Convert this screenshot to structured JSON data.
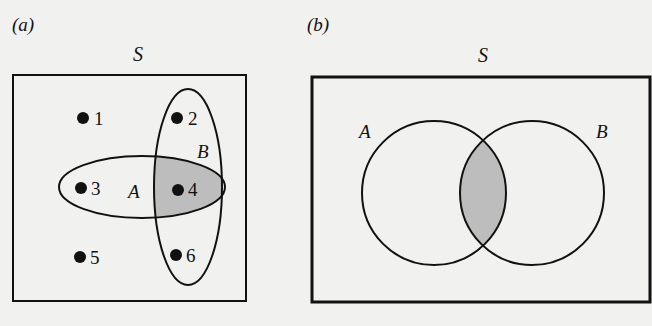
{
  "panels": [
    {
      "id": "a",
      "label": "(a)",
      "universe_label": "S",
      "set_a_label": "A",
      "set_b_label": "B",
      "points": [
        {
          "label": "1"
        },
        {
          "label": "2"
        },
        {
          "label": "3"
        },
        {
          "label": "4"
        },
        {
          "label": "5"
        },
        {
          "label": "6"
        }
      ],
      "shaded_region": "A ∩ B"
    },
    {
      "id": "b",
      "label": "(b)",
      "universe_label": "S",
      "set_a_label": "A",
      "set_b_label": "B",
      "shaded_region": "A ∩ B"
    }
  ],
  "colors": {
    "background": "#f1f1ef",
    "stroke": "#111111",
    "shade": "#bdbdbd"
  }
}
